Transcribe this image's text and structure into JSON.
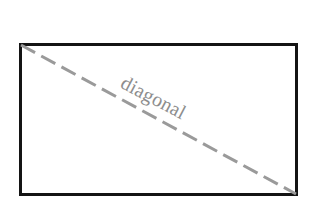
{
  "figure": {
    "name": "rectangle-with-diagonal",
    "background_color": "#ffffff",
    "rectangle": {
      "label": "",
      "border_color": "#141414",
      "border_width_px": 3,
      "x": 19,
      "y": 43,
      "width": 279,
      "height": 153
    },
    "diagonal": {
      "label": "diagonal",
      "color": "#9a9a9a",
      "stroke_width_px": 3,
      "style": "dashed",
      "dash_length_px": 16,
      "gap_length_px": 7,
      "x1": 21,
      "y1": 45,
      "x2": 296,
      "y2": 194,
      "angle_degrees": 28.5
    },
    "label": {
      "text": "diagonal",
      "color": "#8d8d8d",
      "font_size_px": 20,
      "rotation_degrees": 27.5,
      "x": 127,
      "y": 72
    }
  }
}
